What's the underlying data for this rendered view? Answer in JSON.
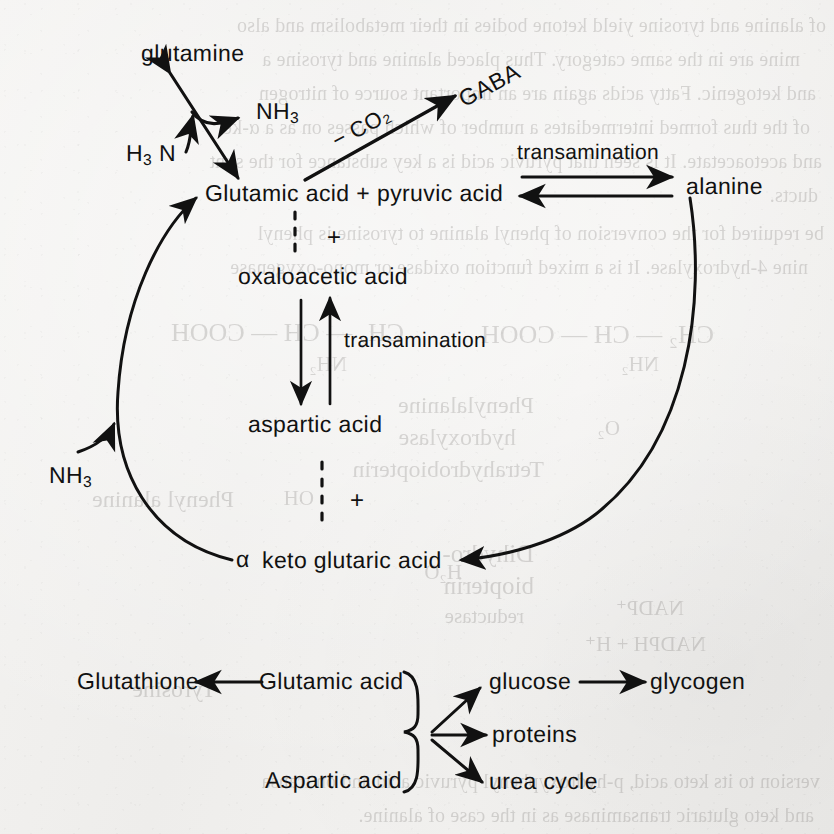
{
  "diagram": {
    "ink_color": "#111111",
    "paper_color": "#f2f1ef"
  },
  "nodes": {
    "glutamine": "glutamine",
    "ammonia_out": "NH₃",
    "h3n": "H₃ N",
    "gaba": "GABA",
    "co2_loss": "− CO₂",
    "glutamic_pyruvic": "Glutamic acid + pyruvic acid",
    "transamination_top": "transamination",
    "alanine": "alanine",
    "plus_top": "+",
    "oxaloacetic": "oxaloacetic acid",
    "transamination_mid": "transamination",
    "aspartic": "aspartic acid",
    "plus_mid": "+",
    "ammonia_in": "NH₃",
    "alpha": "α",
    "keto_glutaric": "keto glutaric acid"
  },
  "bottom_panel": {
    "glutathione": "Glutathione",
    "glutamic_acid": "Glutamic acid",
    "aspartic_acid": "Aspartic acid",
    "glucose": "glucose",
    "glycogen": "glycogen",
    "proteins": "proteins",
    "urea_cycle": "urea cycle"
  },
  "background_showthrough": {
    "lines": [
      "of alanine and tyrosine yield ketone bodies in their metabolism and also",
      "mine are in the same category.  Thus placed alanine and tyrosine a",
      "and ketogenic. Fatty acids again are an important source of nitrogen",
      "of the thus formed intermediates a number of which passes on as a α-ke",
      "and acetoacetate. It is seen that pyruvic acid is a key substance for the synt",
      "ducts.",
      "be required for the conversion of phenyl alanine to tyrosine is phenyl",
      "nine 4-hydroxylase. It is a mixed function oxidase or mono-oxygenase"
    ],
    "chem_fragments": [
      "CH₂ — CH — COOH",
      "CH₂ — CH — COOH",
      "NH₂",
      "NH₂",
      "Phenylalanine",
      "hydroxylase",
      "Tetrahydrobiopterin",
      "OH",
      "O₂",
      "H₂O",
      "Dihydro-",
      "biopterin",
      "reductase",
      "NADP⁺",
      "NADPH + H⁺",
      "Phenyl alanine",
      "Tyrosine",
      "version to its keto acid, p-hydroxyphenyl pyruvic acid and on transa",
      "and keto glutaric transaminase as in the case of alanine."
    ]
  }
}
